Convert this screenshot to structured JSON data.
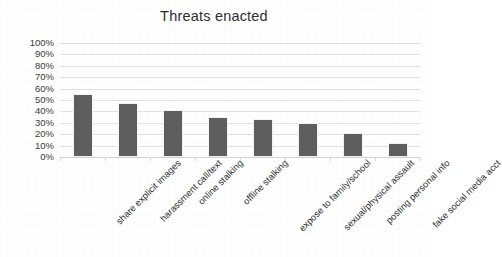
{
  "chart_data": {
    "type": "bar",
    "title": "Threats enacted",
    "xlabel": "",
    "ylabel": "",
    "categories": [
      "share explicit images",
      "harassment call/text",
      "online stalking",
      "offline stalking",
      "expose to family/school",
      "sexual/physical assault",
      "posting personal info",
      "fake social media acct"
    ],
    "values": [
      55,
      47,
      41,
      35,
      33,
      30,
      21,
      12
    ],
    "ylim": [
      0,
      100
    ],
    "ytick_labels": [
      "0%",
      "10%",
      "20%",
      "30%",
      "40%",
      "50%",
      "60%",
      "70%",
      "80%",
      "90%",
      "100%"
    ],
    "ytick_values": [
      0,
      10,
      20,
      30,
      40,
      50,
      60,
      70,
      80,
      90,
      100
    ],
    "grid": true,
    "legend": false,
    "legend_position": "none",
    "bar_color": "#5e5e5e",
    "gridline_color": "#e2e2e2",
    "background_color": "#fefefe",
    "title_color": "#2f2f2f",
    "label_rotation_degrees": -45
  }
}
